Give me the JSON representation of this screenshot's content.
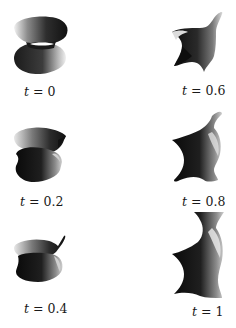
{
  "figure": {
    "panels": [
      {
        "id": "t0",
        "var": "t",
        "eq": " = ",
        "value": "0",
        "label": "t = 0"
      },
      {
        "id": "t02",
        "var": "t",
        "eq": " = ",
        "value": "0.2",
        "label": "t = 0.2"
      },
      {
        "id": "t04",
        "var": "t",
        "eq": " = ",
        "value": "0.4",
        "label": "t = 0.4"
      },
      {
        "id": "t06",
        "var": "t",
        "eq": " = ",
        "value": "0.6",
        "label": "t = 0.6"
      },
      {
        "id": "t08",
        "var": "t",
        "eq": " = ",
        "value": "0.8",
        "label": "t = 0.8"
      },
      {
        "id": "t1",
        "var": "t",
        "eq": " = ",
        "value": "1",
        "label": "t = 1"
      }
    ],
    "layout": {
      "columns": 2,
      "rows": 3,
      "order": "column-major"
    }
  }
}
